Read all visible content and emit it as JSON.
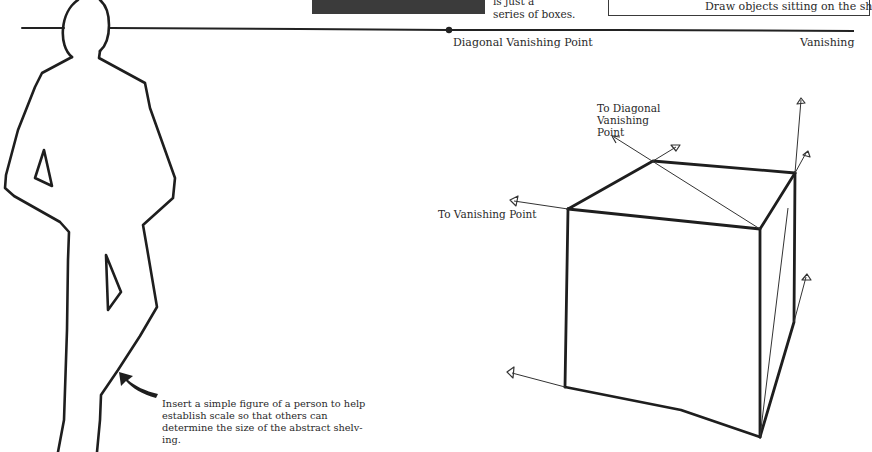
{
  "header": {
    "caption_top": "is just a\nseries of boxes.",
    "note_text": "Draw objects sitting on the sh"
  },
  "horizon": {
    "diagonal_vp_label": "Diagonal Vanishing Point",
    "vp_label": "Vanishing"
  },
  "cube": {
    "to_diagonal_vp_label": "To Diagonal\nVanishing\nPoint",
    "to_vp_label": "To Vanishing Point"
  },
  "figure": {
    "caption": "Insert a simple figure of a person to help establish scale so that others can determine the size of the abstract shelv-ing."
  },
  "colors": {
    "ink": "#222222",
    "dark_box": "#3b3b3b",
    "background": "#ffffff"
  }
}
